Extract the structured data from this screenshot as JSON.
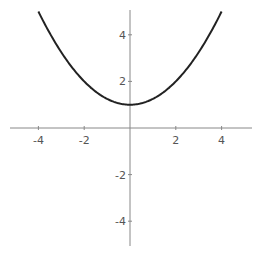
{
  "chart_data": {
    "type": "line",
    "title": "",
    "xlabel": "",
    "ylabel": "",
    "function": "y = x^2/4 + 1",
    "xlim": [
      -5.3,
      5.3
    ],
    "ylim": [
      -5.1,
      5.1
    ],
    "grid": false,
    "legend": null,
    "x_ticks": [
      -4,
      -2,
      2,
      4
    ],
    "y_ticks": [
      4,
      2,
      -2,
      -4
    ],
    "x_tick_labels": [
      "-4",
      "-2",
      "2",
      "4"
    ],
    "y_tick_labels": [
      "4",
      "2",
      "-2",
      "-4"
    ],
    "series": [
      {
        "name": "curve",
        "x": [
          -4,
          -3.5,
          -3,
          -2.5,
          -2,
          -1.5,
          -1,
          -0.5,
          0,
          0.5,
          1,
          1.5,
          2,
          2.5,
          3,
          3.5,
          4
        ],
        "y": [
          5,
          4.0625,
          3.25,
          2.5625,
          2,
          1.5625,
          1.25,
          1.0625,
          1,
          1.0625,
          1.25,
          1.5625,
          2,
          2.5625,
          3.25,
          4.0625,
          5
        ]
      }
    ],
    "colors": {
      "curve": "#222222",
      "axes": "#888888",
      "labels": "#555555"
    }
  }
}
